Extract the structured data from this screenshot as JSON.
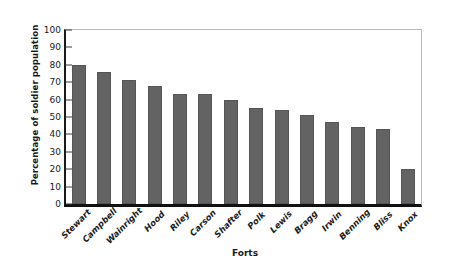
{
  "chart_data": {
    "type": "bar",
    "title": "",
    "xlabel": "Forts",
    "ylabel": "Percentage of soldier population",
    "categories": [
      "Stewart",
      "Campbell",
      "Wainright",
      "Hood",
      "Riley",
      "Carson",
      "Shafter",
      "Polk",
      "Lewis",
      "Bragg",
      "Irwin",
      "Benning",
      "Bliss",
      "Knox"
    ],
    "values": [
      80,
      76,
      71,
      68,
      63,
      63,
      60,
      55,
      54,
      51,
      47,
      44,
      43,
      20
    ],
    "ylim": [
      0,
      100
    ],
    "ytick_labels": [
      "100",
      "90",
      "80",
      "70",
      "60",
      "50",
      "40",
      "30",
      "20",
      "10",
      "0"
    ],
    "ytick_values": [
      100,
      90,
      80,
      70,
      60,
      50,
      40,
      30,
      20,
      10,
      0
    ],
    "grid": false,
    "legend": null,
    "bar_color": "#636363",
    "axis_color": "#111111",
    "frame_color": "#b9b9b9"
  }
}
